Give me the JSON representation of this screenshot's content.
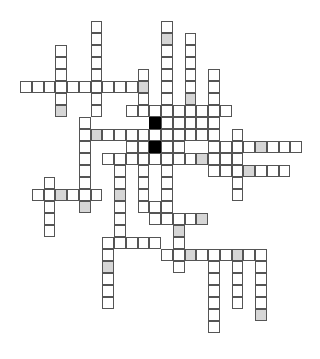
{
  "puzzle": {
    "type": "crossword",
    "cell_states": {
      "empty": "white",
      "shaded": "gray",
      "block": "black"
    },
    "colors": {
      "empty": "#ffffff",
      "shaded": "#d6d6d6",
      "block": "#000000",
      "border": "#555555"
    },
    "cells": [
      {
        "c": 0,
        "r": 5
      },
      {
        "c": 1,
        "r": 5
      },
      {
        "c": 2,
        "r": 5
      },
      {
        "c": 3,
        "r": 5
      },
      {
        "c": 4,
        "r": 5
      },
      {
        "c": 5,
        "r": 5
      },
      {
        "c": 6,
        "r": 5
      },
      {
        "c": 7,
        "r": 5
      },
      {
        "c": 8,
        "r": 5
      },
      {
        "c": 9,
        "r": 5
      },
      {
        "c": 10,
        "r": 5,
        "s": "shaded"
      },
      {
        "c": 3,
        "r": 2
      },
      {
        "c": 3,
        "r": 3
      },
      {
        "c": 3,
        "r": 4
      },
      {
        "c": 3,
        "r": 6
      },
      {
        "c": 3,
        "r": 7,
        "s": "shaded"
      },
      {
        "c": 6,
        "r": 0
      },
      {
        "c": 6,
        "r": 1
      },
      {
        "c": 6,
        "r": 2
      },
      {
        "c": 6,
        "r": 3
      },
      {
        "c": 6,
        "r": 4
      },
      {
        "c": 6,
        "r": 6
      },
      {
        "c": 6,
        "r": 7
      },
      {
        "c": 10,
        "r": 4
      },
      {
        "c": 10,
        "r": 6
      },
      {
        "c": 10,
        "r": 7
      },
      {
        "c": 12,
        "r": 0
      },
      {
        "c": 12,
        "r": 1,
        "s": "shaded"
      },
      {
        "c": 12,
        "r": 2
      },
      {
        "c": 12,
        "r": 3
      },
      {
        "c": 12,
        "r": 4
      },
      {
        "c": 12,
        "r": 5
      },
      {
        "c": 12,
        "r": 6
      },
      {
        "c": 12,
        "r": 7
      },
      {
        "c": 12,
        "r": 8
      },
      {
        "c": 12,
        "r": 9
      },
      {
        "c": 14,
        "r": 1
      },
      {
        "c": 14,
        "r": 2
      },
      {
        "c": 14,
        "r": 3
      },
      {
        "c": 14,
        "r": 4
      },
      {
        "c": 14,
        "r": 5
      },
      {
        "c": 14,
        "r": 6,
        "s": "shaded"
      },
      {
        "c": 14,
        "r": 7
      },
      {
        "c": 14,
        "r": 8
      },
      {
        "c": 14,
        "r": 9
      },
      {
        "c": 16,
        "r": 4
      },
      {
        "c": 16,
        "r": 5
      },
      {
        "c": 16,
        "r": 6
      },
      {
        "c": 16,
        "r": 7
      },
      {
        "c": 16,
        "r": 8
      },
      {
        "c": 16,
        "r": 9
      },
      {
        "c": 16,
        "r": 10
      },
      {
        "c": 16,
        "r": 11
      },
      {
        "c": 9,
        "r": 7
      },
      {
        "c": 10,
        "r": 7
      },
      {
        "c": 11,
        "r": 7
      },
      {
        "c": 13,
        "r": 7
      },
      {
        "c": 15,
        "r": 7
      },
      {
        "c": 17,
        "r": 7
      },
      {
        "c": 5,
        "r": 8
      },
      {
        "c": 5,
        "r": 9
      },
      {
        "c": 6,
        "r": 9,
        "s": "shaded"
      },
      {
        "c": 7,
        "r": 9
      },
      {
        "c": 8,
        "r": 9
      },
      {
        "c": 9,
        "r": 9
      },
      {
        "c": 10,
        "r": 9
      },
      {
        "c": 11,
        "r": 9
      },
      {
        "c": 13,
        "r": 9
      },
      {
        "c": 15,
        "r": 9
      },
      {
        "c": 11,
        "r": 8,
        "s": "block"
      },
      {
        "c": 11,
        "r": 10,
        "s": "block"
      },
      {
        "c": 5,
        "r": 10
      },
      {
        "c": 9,
        "r": 10
      },
      {
        "c": 10,
        "r": 10
      },
      {
        "c": 12,
        "r": 10
      },
      {
        "c": 13,
        "r": 10
      },
      {
        "c": 13,
        "r": 8
      },
      {
        "c": 15,
        "r": 8
      },
      {
        "c": 18,
        "r": 9
      },
      {
        "c": 18,
        "r": 10
      },
      {
        "c": 17,
        "r": 10
      },
      {
        "c": 19,
        "r": 10
      },
      {
        "c": 20,
        "r": 10,
        "s": "shaded"
      },
      {
        "c": 21,
        "r": 10
      },
      {
        "c": 22,
        "r": 10
      },
      {
        "c": 23,
        "r": 10
      },
      {
        "c": 5,
        "r": 11
      },
      {
        "c": 7,
        "r": 11
      },
      {
        "c": 8,
        "r": 11
      },
      {
        "c": 9,
        "r": 11
      },
      {
        "c": 10,
        "r": 11
      },
      {
        "c": 11,
        "r": 11
      },
      {
        "c": 12,
        "r": 11
      },
      {
        "c": 13,
        "r": 11
      },
      {
        "c": 14,
        "r": 11
      },
      {
        "c": 15,
        "r": 11,
        "s": "shaded"
      },
      {
        "c": 16,
        "r": 11
      },
      {
        "c": 17,
        "r": 11
      },
      {
        "c": 18,
        "r": 11
      },
      {
        "c": 16,
        "r": 12
      },
      {
        "c": 17,
        "r": 12
      },
      {
        "c": 18,
        "r": 12
      },
      {
        "c": 19,
        "r": 12,
        "s": "shaded"
      },
      {
        "c": 20,
        "r": 12
      },
      {
        "c": 21,
        "r": 12
      },
      {
        "c": 22,
        "r": 12
      },
      {
        "c": 5,
        "r": 12
      },
      {
        "c": 8,
        "r": 12
      },
      {
        "c": 10,
        "r": 12
      },
      {
        "c": 12,
        "r": 12
      },
      {
        "c": 18,
        "r": 13
      },
      {
        "c": 18,
        "r": 14
      },
      {
        "c": 2,
        "r": 13
      },
      {
        "c": 2,
        "r": 14
      },
      {
        "c": 1,
        "r": 14
      },
      {
        "c": 3,
        "r": 14,
        "s": "shaded"
      },
      {
        "c": 4,
        "r": 14
      },
      {
        "c": 5,
        "r": 14
      },
      {
        "c": 6,
        "r": 14
      },
      {
        "c": 5,
        "r": 13
      },
      {
        "c": 5,
        "r": 15,
        "s": "shaded"
      },
      {
        "c": 2,
        "r": 15
      },
      {
        "c": 2,
        "r": 16
      },
      {
        "c": 2,
        "r": 17
      },
      {
        "c": 8,
        "r": 13
      },
      {
        "c": 8,
        "r": 14,
        "s": "shaded"
      },
      {
        "c": 8,
        "r": 15
      },
      {
        "c": 8,
        "r": 16
      },
      {
        "c": 8,
        "r": 17
      },
      {
        "c": 10,
        "r": 13
      },
      {
        "c": 10,
        "r": 14
      },
      {
        "c": 10,
        "r": 15
      },
      {
        "c": 11,
        "r": 15
      },
      {
        "c": 12,
        "r": 13
      },
      {
        "c": 12,
        "r": 14
      },
      {
        "c": 12,
        "r": 15
      },
      {
        "c": 11,
        "r": 16
      },
      {
        "c": 12,
        "r": 16
      },
      {
        "c": 13,
        "r": 16
      },
      {
        "c": 14,
        "r": 16
      },
      {
        "c": 15,
        "r": 16,
        "s": "shaded"
      },
      {
        "c": 13,
        "r": 17,
        "s": "shaded"
      },
      {
        "c": 13,
        "r": 18
      },
      {
        "c": 7,
        "r": 18
      },
      {
        "c": 8,
        "r": 18
      },
      {
        "c": 9,
        "r": 18
      },
      {
        "c": 10,
        "r": 18
      },
      {
        "c": 11,
        "r": 18
      },
      {
        "c": 7,
        "r": 19
      },
      {
        "c": 7,
        "r": 20,
        "s": "shaded"
      },
      {
        "c": 7,
        "r": 21
      },
      {
        "c": 7,
        "r": 22
      },
      {
        "c": 7,
        "r": 23
      },
      {
        "c": 12,
        "r": 19
      },
      {
        "c": 13,
        "r": 19
      },
      {
        "c": 14,
        "r": 19,
        "s": "shaded"
      },
      {
        "c": 15,
        "r": 19
      },
      {
        "c": 16,
        "r": 19
      },
      {
        "c": 17,
        "r": 19
      },
      {
        "c": 18,
        "r": 19,
        "s": "shaded"
      },
      {
        "c": 19,
        "r": 19
      },
      {
        "c": 20,
        "r": 19
      },
      {
        "c": 13,
        "r": 20
      },
      {
        "c": 16,
        "r": 20
      },
      {
        "c": 16,
        "r": 21
      },
      {
        "c": 16,
        "r": 22
      },
      {
        "c": 16,
        "r": 23
      },
      {
        "c": 16,
        "r": 24
      },
      {
        "c": 16,
        "r": 25
      },
      {
        "c": 18,
        "r": 20
      },
      {
        "c": 18,
        "r": 21
      },
      {
        "c": 18,
        "r": 22
      },
      {
        "c": 18,
        "r": 23
      },
      {
        "c": 20,
        "r": 20
      },
      {
        "c": 20,
        "r": 21
      },
      {
        "c": 20,
        "r": 22
      },
      {
        "c": 20,
        "r": 23
      },
      {
        "c": 20,
        "r": 24,
        "s": "shaded"
      }
    ]
  }
}
